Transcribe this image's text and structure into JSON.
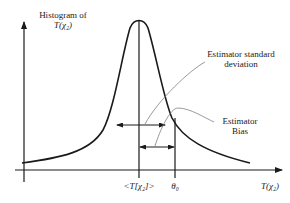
{
  "diagram": {
    "y_axis_label_line1": "Histogram of",
    "y_axis_label_line2": "T(χ₂)",
    "x_axis_label": "T(χ₂)",
    "tick_mean_label": "<T[χ₂]>",
    "tick_theta_label": "θ₀",
    "annotation_std_line1": "Estimator standard",
    "annotation_std_line2": "deviation",
    "annotation_bias_line1": "Estimator",
    "annotation_bias_line2": "Bias",
    "colors": {
      "curve": "#1a1a1a",
      "axes": "#1a1a1a",
      "leader": "#808080"
    }
  }
}
